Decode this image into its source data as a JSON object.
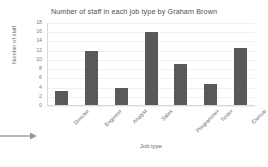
{
  "chart_data": {
    "type": "bar",
    "title": "Number of staff in each job type by Graham Brown",
    "xlabel": "Job type",
    "ylabel": "Number of staff",
    "categories": [
      "Director",
      "Engineer",
      "Analyst",
      "Sales",
      "Programmer",
      "Tester",
      "Clerical"
    ],
    "values": [
      3,
      11.8,
      3.6,
      15.8,
      8.8,
      4.5,
      12.3
    ],
    "ylim": [
      0,
      18
    ],
    "yticks": [
      0,
      2,
      4,
      6,
      8,
      10,
      12,
      14,
      16,
      18
    ],
    "grid": true,
    "legend": null,
    "bar_color": "#595959",
    "gridline_color": "#f0f0f0",
    "axis_color": "#d9d9d9"
  },
  "annotations": {
    "arrow": "arrow-right-icon"
  }
}
